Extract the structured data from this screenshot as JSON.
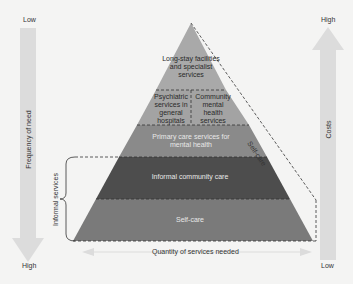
{
  "diagram": {
    "left_axis": {
      "top_label": "Low",
      "bottom_label": "High",
      "axis_label": "Frequency of need"
    },
    "right_axis": {
      "top_label": "High",
      "bottom_label": "Low",
      "axis_label": "Costs"
    },
    "bottom_axis": {
      "label": "Quantity of services needed"
    },
    "bracket_label": "Informal services",
    "side_label": "Self-care",
    "tiers": [
      {
        "label": "Long-stay facilities and specialist services",
        "color": "#a9a9a9"
      },
      {
        "label": "Psychiatric services in general hospitals",
        "color": "#a3a3a3"
      },
      {
        "label": "Community mental health services",
        "color": "#a3a3a3"
      },
      {
        "label": "Primary care services for mental health",
        "color": "#8a8a8a"
      },
      {
        "label": "Informal community care",
        "color": "#4d4d4d"
      },
      {
        "label": "Self-care",
        "color": "#7a7a7a"
      }
    ],
    "colors": {
      "background": "#f4f4f3",
      "axis_arrow": "#dcdcdc",
      "dashed_line": "#333333"
    }
  }
}
